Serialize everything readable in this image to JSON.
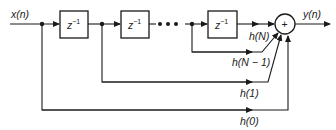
{
  "diagram": {
    "type": "FIR filter direct-form block diagram",
    "input_label": "x(n)",
    "output_label": "y(n)",
    "delay_label": "z",
    "delay_exponent": "−1",
    "summer_symbol": "+",
    "ellipsis": "• • •",
    "delay_count_visible": 3,
    "coefficients": [
      {
        "id": "hN",
        "label": "h(N)"
      },
      {
        "id": "hN1",
        "label": "h(N − 1)"
      },
      {
        "id": "h1",
        "label": "h(1)"
      },
      {
        "id": "h0",
        "label": "h(0)"
      }
    ],
    "colors": {
      "line": "#1a1a1a",
      "background": "#ffffff"
    }
  }
}
